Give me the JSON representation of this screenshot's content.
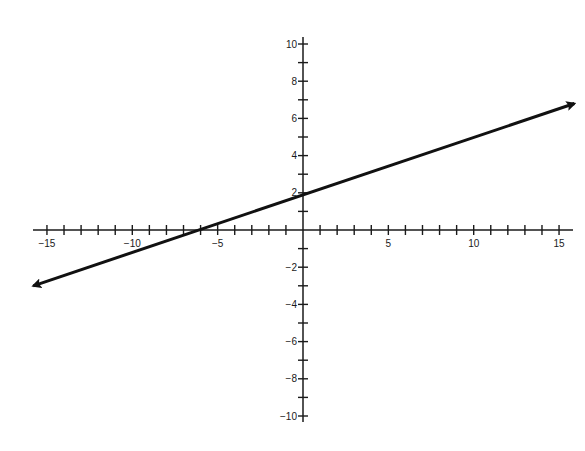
{
  "chart_data": {
    "type": "line",
    "title": "",
    "xlabel": "",
    "ylabel": "",
    "xlim": [
      -15.8,
      15.9
    ],
    "ylim": [
      -10,
      10
    ],
    "grid": false,
    "legend": null,
    "x_ticks": [
      -15,
      -14,
      -13,
      -12,
      -11,
      -10,
      -9,
      -8,
      -7,
      -6,
      -5,
      -4,
      -3,
      -2,
      -1,
      1,
      2,
      3,
      4,
      5,
      6,
      7,
      8,
      9,
      10,
      11,
      12,
      13,
      14,
      15
    ],
    "x_tick_labels": [
      {
        "value": -15,
        "label": "−15"
      },
      {
        "value": -10,
        "label": "−10"
      },
      {
        "value": -5,
        "label": "−5"
      },
      {
        "value": 5,
        "label": "5"
      },
      {
        "value": 10,
        "label": "10"
      },
      {
        "value": 15,
        "label": "15"
      }
    ],
    "y_ticks": [
      -10,
      -9,
      -8,
      -7,
      -6,
      -5,
      -4,
      -3,
      -2,
      -1,
      1,
      2,
      3,
      4,
      5,
      6,
      7,
      8,
      9,
      10
    ],
    "y_tick_labels": [
      {
        "value": 10,
        "label": "10"
      },
      {
        "value": 8,
        "label": "8"
      },
      {
        "value": 6,
        "label": "6"
      },
      {
        "value": 4,
        "label": "4"
      },
      {
        "value": 2,
        "label": "2"
      },
      {
        "value": -2,
        "label": "−2"
      },
      {
        "value": -4,
        "label": "−4"
      },
      {
        "value": -6,
        "label": "−6"
      },
      {
        "value": -8,
        "label": "−8"
      },
      {
        "value": -10,
        "label": "−10"
      }
    ],
    "series": [
      {
        "name": "line",
        "equation": "y = x/3 + 2",
        "slope": 0.333,
        "y_intercept": 2,
        "x_intercept": -6,
        "x": [
          -15.8,
          15.9
        ],
        "y": [
          -3.0,
          6.8
        ],
        "arrows": "both",
        "color": "#111111"
      }
    ]
  },
  "layout": {
    "origin_px": [
      303,
      230
    ],
    "x_px_per_unit": 17.07,
    "y_px_per_unit": 18.6,
    "axis_color": "#1a1a1a",
    "x_axis_extent_px": [
      33,
      573
    ],
    "y_axis_extent_px": [
      37,
      422
    ]
  }
}
